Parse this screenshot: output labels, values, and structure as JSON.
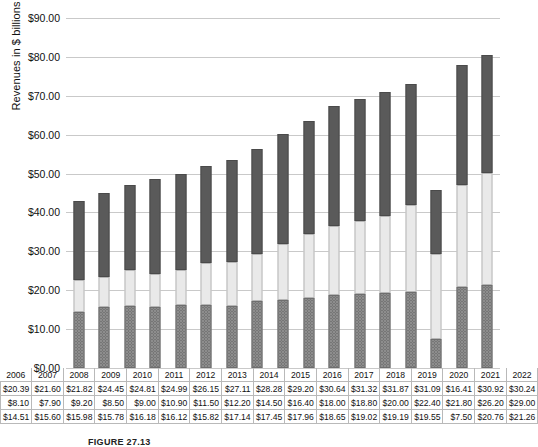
{
  "chart_data": {
    "type": "bar",
    "stacked": true,
    "title": "",
    "xlabel": "",
    "ylabel": "Revenues in $ billions",
    "ylim": [
      0,
      90
    ],
    "ytick_step": 10,
    "ytick_labels": [
      "$0.00",
      "$10.00",
      "$20.00",
      "$30.00",
      "$40.00",
      "$50.00",
      "$60.00",
      "$70.00",
      "$80.00",
      "$90.00"
    ],
    "grid": true,
    "legend_position": "table-rows",
    "categories": [
      "2006",
      "2007",
      "2008",
      "2009",
      "2010",
      "2011",
      "2012",
      "2013",
      "2014",
      "2015",
      "2016",
      "2017",
      "2018",
      "2019",
      "2020",
      "2021",
      "2022"
    ],
    "series": [
      {
        "name": "Gate Receipts",
        "color": "#8d8d8d",
        "pattern": "dotted",
        "stack_order": 0,
        "values": [
          14.51,
          15.6,
          15.98,
          15.78,
          16.18,
          16.12,
          15.82,
          17.14,
          17.45,
          17.96,
          18.65,
          19.02,
          19.19,
          19.55,
          7.5,
          20.76,
          21.26
        ],
        "labels": [
          "$14.51",
          "$15.60",
          "$15.98",
          "$15.78",
          "$16.18",
          "$16.12",
          "$15.82",
          "$17.14",
          "$17.45",
          "$17.96",
          "$18.65",
          "$19.02",
          "$19.19",
          "$19.55",
          "$7.50",
          "$20.76",
          "$21.26"
        ]
      },
      {
        "name": "Media",
        "color": "#e9e9e9",
        "pattern": "solid",
        "stack_order": 1,
        "values": [
          8.1,
          7.9,
          9.2,
          8.5,
          9.0,
          10.9,
          11.5,
          12.2,
          14.5,
          16.4,
          18.0,
          18.8,
          20.0,
          22.4,
          21.8,
          26.2,
          29.0
        ],
        "labels": [
          "$8.10",
          "$7.90",
          "$9.20",
          "$8.50",
          "$9.00",
          "$10.90",
          "$11.50",
          "$12.20",
          "$14.50",
          "$16.40",
          "$18.00",
          "$18.80",
          "$20.00",
          "$22.40",
          "$21.80",
          "$26.20",
          "$29.00"
        ]
      },
      {
        "name": "Sponsorship & Merchandising",
        "color": "#5a5a5a",
        "pattern": "solid",
        "stack_order": 2,
        "values": [
          20.39,
          21.6,
          21.82,
          24.45,
          24.81,
          24.99,
          26.15,
          27.11,
          28.28,
          29.2,
          30.64,
          31.32,
          31.87,
          31.09,
          16.41,
          30.92,
          30.24
        ],
        "labels": [
          "$20.39",
          "$21.60",
          "$21.82",
          "$24.45",
          "$24.81",
          "$24.99",
          "$26.15",
          "$27.11",
          "$28.28",
          "$29.20",
          "$30.64",
          "$31.32",
          "$31.87",
          "$31.09",
          "$16.41",
          "$30.92",
          "$30.24"
        ]
      }
    ],
    "totals": [
      43.0,
      45.1,
      47.0,
      48.73,
      50.0,
      52.01,
      53.47,
      56.45,
      60.23,
      63.56,
      67.29,
      69.14,
      71.06,
      73.04,
      45.71,
      77.88,
      80.5
    ]
  },
  "table": {
    "row_labels": [
      "Sponsorship & Merchandising",
      "Media",
      "Gate Receipts"
    ]
  },
  "caption": "FIGURE 27.13"
}
